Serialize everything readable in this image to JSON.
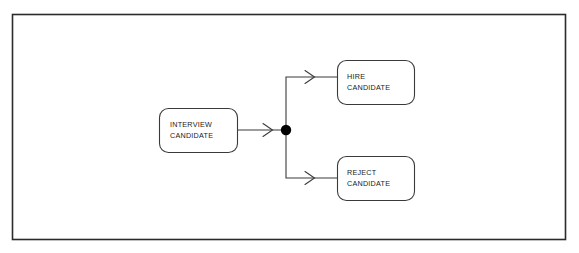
{
  "diagram": {
    "type": "uml-activity-diagram",
    "colors": {
      "frame_stroke": "#2b2b2b",
      "node_stroke": "#3a3a3a",
      "node_fill": "#ffffff",
      "connector_stroke": "#3a3a3a",
      "junction_fill": "#000000",
      "text": "#1a1a1a",
      "background": "#ffffff"
    },
    "frame": {
      "name": "diagram-border-frame",
      "x": 12,
      "y": 14,
      "width": 554,
      "height": 226
    },
    "nodes": [
      {
        "id": "interview-candidate",
        "role": "source-activity",
        "lines": [
          "INTERVIEW",
          "CANDIDATE"
        ],
        "x": 159,
        "y": 108,
        "width": 79,
        "height": 45,
        "radius": 9
      },
      {
        "id": "hire-candidate",
        "role": "target-activity",
        "lines": [
          "HIRE",
          "CANDIDATE"
        ],
        "x": 337,
        "y": 60,
        "width": 78,
        "height": 45,
        "radius": 9
      },
      {
        "id": "reject-candidate",
        "role": "target-activity",
        "lines": [
          "REJECT",
          "CANDIDATE"
        ],
        "x": 337,
        "y": 156,
        "width": 78,
        "height": 45,
        "radius": 9
      }
    ],
    "junction": {
      "id": "fork-junction-node",
      "cx": 286,
      "cy": 130,
      "r": 5.2
    },
    "connectors": [
      {
        "id": "interview-to-junction",
        "from": "interview-candidate",
        "to": "fork-junction-node",
        "path": "M 238 130 L 281 130",
        "arrow": {
          "x": 270,
          "y": 130
        }
      },
      {
        "id": "junction-to-hire",
        "from": "fork-junction-node",
        "to": "hire-candidate",
        "path": "M 286 125 L 286 77 L 337 77",
        "arrow": {
          "x": 312,
          "y": 77
        }
      },
      {
        "id": "junction-to-reject",
        "from": "fork-junction-node",
        "to": "reject-candidate",
        "path": "M 286 135 L 286 178 L 337 178",
        "arrow": {
          "x": 312,
          "y": 178
        }
      }
    ]
  }
}
